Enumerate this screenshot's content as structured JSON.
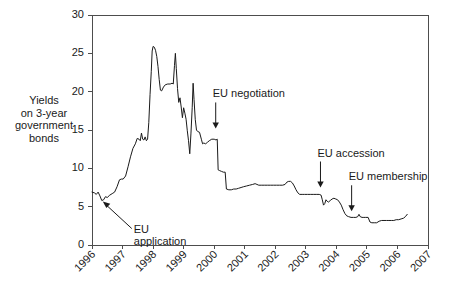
{
  "chart_data": {
    "type": "line",
    "title": "",
    "xlabel": "",
    "ylabel": "Yields\non 3-year\ngovernment\nbonds",
    "ylabel_lines": [
      "Yields",
      "on 3-year",
      "government",
      "bonds"
    ],
    "xlim": [
      1996.0,
      2007.0
    ],
    "ylim": [
      0,
      30
    ],
    "yticks": [
      0,
      5,
      10,
      15,
      20,
      25,
      30
    ],
    "ytick_labels": [
      "0",
      "5",
      "10",
      "15",
      "20",
      "25",
      "30"
    ],
    "xticks": [
      1996,
      1997,
      1998,
      1999,
      2000,
      2001,
      2002,
      2003,
      2004,
      2005,
      2006,
      2007
    ],
    "xtick_labels": [
      "1996",
      "1997",
      "1998",
      "1999",
      "2000",
      "2001",
      "2002",
      "2003",
      "2004",
      "2005",
      "2006",
      "2007"
    ],
    "grid": false,
    "legend": false,
    "line_color": "#1a1a1a",
    "series": [
      {
        "name": "Yields on 3-year government bonds",
        "points": [
          [
            1996.0,
            6.9
          ],
          [
            1996.08,
            6.8
          ],
          [
            1996.14,
            6.6
          ],
          [
            1996.2,
            6.9
          ],
          [
            1996.26,
            6.4
          ],
          [
            1996.32,
            5.8
          ],
          [
            1996.38,
            5.9
          ],
          [
            1996.44,
            6.3
          ],
          [
            1996.5,
            6.2
          ],
          [
            1996.58,
            6.5
          ],
          [
            1996.66,
            6.7
          ],
          [
            1996.74,
            6.9
          ],
          [
            1996.82,
            7.6
          ],
          [
            1996.9,
            8.5
          ],
          [
            1996.96,
            8.6
          ],
          [
            1997.02,
            8.6
          ],
          [
            1997.1,
            9.0
          ],
          [
            1997.18,
            10.2
          ],
          [
            1997.26,
            11.5
          ],
          [
            1997.34,
            12.6
          ],
          [
            1997.42,
            13.2
          ],
          [
            1997.48,
            13.9
          ],
          [
            1997.54,
            13.8
          ],
          [
            1997.58,
            13.6
          ],
          [
            1997.62,
            14.6
          ],
          [
            1997.66,
            13.8
          ],
          [
            1997.7,
            13.7
          ],
          [
            1997.74,
            14.1
          ],
          [
            1997.78,
            13.6
          ],
          [
            1997.82,
            13.8
          ],
          [
            1997.86,
            16.0
          ],
          [
            1997.9,
            19.6
          ],
          [
            1997.94,
            22.6
          ],
          [
            1997.97,
            25.3
          ],
          [
            1998.0,
            25.9
          ],
          [
            1998.04,
            25.8
          ],
          [
            1998.08,
            25.4
          ],
          [
            1998.12,
            24.6
          ],
          [
            1998.16,
            23.3
          ],
          [
            1998.2,
            21.6
          ],
          [
            1998.24,
            20.2
          ],
          [
            1998.28,
            20.1
          ],
          [
            1998.34,
            20.6
          ],
          [
            1998.4,
            20.9
          ],
          [
            1998.48,
            21.0
          ],
          [
            1998.56,
            21.0
          ],
          [
            1998.62,
            21.1
          ],
          [
            1998.66,
            21.0
          ],
          [
            1998.7,
            23.4
          ],
          [
            1998.73,
            25.0
          ],
          [
            1998.76,
            23.0
          ],
          [
            1998.8,
            20.4
          ],
          [
            1998.84,
            18.6
          ],
          [
            1998.88,
            19.2
          ],
          [
            1998.92,
            18.0
          ],
          [
            1998.96,
            16.6
          ],
          [
            1999.0,
            17.9
          ],
          [
            1999.04,
            17.2
          ],
          [
            1999.08,
            16.4
          ],
          [
            1999.12,
            14.9
          ],
          [
            1999.16,
            13.6
          ],
          [
            1999.2,
            11.9
          ],
          [
            1999.24,
            14.6
          ],
          [
            1999.28,
            17.9
          ],
          [
            1999.31,
            21.1
          ],
          [
            1999.34,
            19.0
          ],
          [
            1999.38,
            16.4
          ],
          [
            1999.42,
            15.0
          ],
          [
            1999.46,
            14.8
          ],
          [
            1999.52,
            14.7
          ],
          [
            1999.58,
            13.8
          ],
          [
            1999.62,
            13.2
          ],
          [
            1999.66,
            13.3
          ],
          [
            1999.72,
            13.2
          ],
          [
            1999.78,
            13.4
          ],
          [
            1999.84,
            13.6
          ],
          [
            1999.92,
            13.8
          ],
          [
            2000.0,
            13.8
          ],
          [
            2000.06,
            13.7
          ],
          [
            2000.1,
            13.8
          ],
          [
            2000.13,
            9.8
          ],
          [
            2000.18,
            9.7
          ],
          [
            2000.24,
            9.6
          ],
          [
            2000.3,
            9.5
          ],
          [
            2000.36,
            9.5
          ],
          [
            2000.4,
            7.3
          ],
          [
            2000.48,
            7.2
          ],
          [
            2000.56,
            7.2
          ],
          [
            2000.64,
            7.3
          ],
          [
            2000.72,
            7.3
          ],
          [
            2000.8,
            7.4
          ],
          [
            2000.88,
            7.5
          ],
          [
            2000.96,
            7.6
          ],
          [
            2001.06,
            7.7
          ],
          [
            2001.16,
            7.8
          ],
          [
            2001.26,
            7.9
          ],
          [
            2001.34,
            8.0
          ],
          [
            2001.4,
            7.9
          ],
          [
            2001.46,
            7.8
          ],
          [
            2001.54,
            7.8
          ],
          [
            2001.64,
            7.8
          ],
          [
            2001.74,
            7.8
          ],
          [
            2001.84,
            7.8
          ],
          [
            2001.94,
            7.8
          ],
          [
            2002.04,
            7.8
          ],
          [
            2002.14,
            7.8
          ],
          [
            2002.24,
            7.8
          ],
          [
            2002.32,
            7.9
          ],
          [
            2002.38,
            8.2
          ],
          [
            2002.44,
            8.3
          ],
          [
            2002.5,
            8.3
          ],
          [
            2002.56,
            8.1
          ],
          [
            2002.62,
            7.7
          ],
          [
            2002.68,
            7.2
          ],
          [
            2002.74,
            6.8
          ],
          [
            2002.8,
            6.6
          ],
          [
            2002.88,
            6.6
          ],
          [
            2002.96,
            6.6
          ],
          [
            2003.06,
            6.6
          ],
          [
            2003.16,
            6.6
          ],
          [
            2003.26,
            6.6
          ],
          [
            2003.36,
            6.6
          ],
          [
            2003.44,
            6.6
          ],
          [
            2003.5,
            6.5
          ],
          [
            2003.54,
            5.9
          ],
          [
            2003.58,
            5.2
          ],
          [
            2003.62,
            5.4
          ],
          [
            2003.66,
            5.9
          ],
          [
            2003.7,
            5.7
          ],
          [
            2003.74,
            5.6
          ],
          [
            2003.8,
            5.8
          ],
          [
            2003.86,
            6.0
          ],
          [
            2003.92,
            6.1
          ],
          [
            2003.98,
            6.0
          ],
          [
            2004.04,
            5.9
          ],
          [
            2004.1,
            5.6
          ],
          [
            2004.16,
            5.2
          ],
          [
            2004.22,
            4.6
          ],
          [
            2004.28,
            4.1
          ],
          [
            2004.34,
            3.8
          ],
          [
            2004.4,
            3.7
          ],
          [
            2004.48,
            3.6
          ],
          [
            2004.56,
            3.6
          ],
          [
            2004.64,
            3.6
          ],
          [
            2004.7,
            3.7
          ],
          [
            2004.74,
            4.0
          ],
          [
            2004.78,
            3.7
          ],
          [
            2004.84,
            3.6
          ],
          [
            2004.9,
            3.6
          ],
          [
            2004.96,
            3.6
          ],
          [
            2005.04,
            3.6
          ],
          [
            2005.1,
            3.0
          ],
          [
            2005.16,
            2.9
          ],
          [
            2005.24,
            2.9
          ],
          [
            2005.32,
            2.9
          ],
          [
            2005.4,
            3.1
          ],
          [
            2005.48,
            3.2
          ],
          [
            2005.56,
            3.2
          ],
          [
            2005.64,
            3.2
          ],
          [
            2005.72,
            3.2
          ],
          [
            2005.8,
            3.2
          ],
          [
            2005.88,
            3.2
          ],
          [
            2005.96,
            3.3
          ],
          [
            2006.04,
            3.3
          ],
          [
            2006.12,
            3.4
          ],
          [
            2006.2,
            3.5
          ],
          [
            2006.26,
            3.7
          ],
          [
            2006.32,
            4.0
          ]
        ]
      }
    ],
    "annotations": [
      {
        "id": "eu-application",
        "label_lines": [
          "EU",
          "application"
        ],
        "label": "EU application",
        "target_x": 1996.32,
        "target_y": 5.8,
        "arrow_direction": "diagonal-up-left"
      },
      {
        "id": "eu-negotiation",
        "label_lines": [
          "EU negotiation"
        ],
        "label": "EU negotiation",
        "target_x": 2000.05,
        "target_y": 15.2,
        "arrow_direction": "down"
      },
      {
        "id": "eu-accession",
        "label_lines": [
          "EU accession"
        ],
        "label": "EU accession",
        "target_x": 2003.48,
        "target_y": 7.5,
        "arrow_direction": "down"
      },
      {
        "id": "eu-membership",
        "label_lines": [
          "EU membership"
        ],
        "label": "EU membership",
        "target_x": 2004.5,
        "target_y": 4.4,
        "arrow_direction": "down"
      }
    ]
  }
}
